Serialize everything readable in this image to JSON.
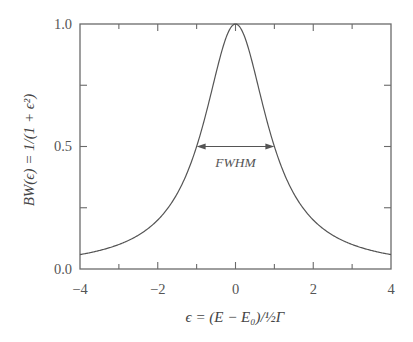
{
  "chart_data": {
    "type": "line",
    "title": "",
    "function": "BW(ε) = 1/(1 + ε²)",
    "xlabel": "ϵ = (E − E₀)/½Γ",
    "ylabel": "BW(ϵ) = 1/(1 + ϵ²)",
    "xlim": [
      -4,
      4
    ],
    "ylim": [
      0.0,
      1.0
    ],
    "x_ticks": [
      -4,
      -3,
      -2,
      -1,
      0,
      1,
      2,
      3,
      4
    ],
    "x_tick_labels": [
      "−4",
      "−2",
      "0",
      "2",
      "4"
    ],
    "x_tick_label_values": [
      -4,
      -2,
      0,
      2,
      4
    ],
    "y_ticks": [
      0.0,
      0.25,
      0.5,
      0.75,
      1.0
    ],
    "y_tick_labels": [
      "0.0",
      "0.5",
      "1.0"
    ],
    "y_tick_label_values": [
      0.0,
      0.5,
      1.0
    ],
    "grid": false,
    "legend": null,
    "series": [
      {
        "name": "Breit-Wigner",
        "x": [
          -4,
          -3.5,
          -3,
          -2.5,
          -2,
          -1.5,
          -1,
          -0.75,
          -0.5,
          -0.25,
          0,
          0.25,
          0.5,
          0.75,
          1,
          1.5,
          2,
          2.5,
          3,
          3.5,
          4
        ],
        "y": [
          0.059,
          0.075,
          0.1,
          0.138,
          0.2,
          0.308,
          0.5,
          0.64,
          0.8,
          0.941,
          1.0,
          0.941,
          0.8,
          0.64,
          0.5,
          0.308,
          0.2,
          0.138,
          0.1,
          0.075,
          0.059
        ]
      }
    ],
    "annotations": [
      {
        "text": "FWHM",
        "type": "double-arrow",
        "x_from": -1,
        "x_to": 1,
        "y": 0.5
      }
    ]
  },
  "labels": {
    "xlabel": "ϵ = (E − E₀)/½Γ",
    "ylabel": "BW(ϵ) = 1/(1 + ϵ²)",
    "fwhm": "FWHM",
    "x_ticks": [
      "−4",
      "−2",
      "0",
      "2",
      "4"
    ],
    "y_ticks": [
      "0.0",
      "0.5",
      "1.0"
    ]
  }
}
